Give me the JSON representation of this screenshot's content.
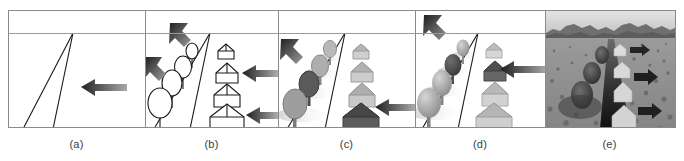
{
  "figure": {
    "title": "Progressive scene rendering stages along a perspective road",
    "panel_count": 5,
    "background_color": "#ffffff",
    "border_color": "#8a8a8a",
    "horizon_color": "#9a9a9a",
    "caption_color": "#3b3b3b"
  },
  "panels": [
    {
      "id": "a",
      "caption": "(a)",
      "description": "Empty scene: horizon line and two converging perspective road edges meeting at the vanishing point",
      "objects": {
        "trees": 0,
        "houses": 0
      },
      "road": {
        "vanishing_point": [
          64,
          22
        ],
        "left_edge_bottom": [
          14,
          118
        ],
        "right_edge_bottom": [
          44,
          118
        ]
      },
      "arrows": [
        {
          "name": "arrow-left-road",
          "x": 72,
          "y": 72,
          "length": 46,
          "direction": "left",
          "shade": "dark-gradient"
        }
      ],
      "style": "line-art-empty"
    },
    {
      "id": "b",
      "caption": "(b)",
      "description": "Line-drawing scene: outlined trees on the left of the road, outlined houses on the right",
      "objects": {
        "trees": 4,
        "houses": 4
      },
      "road": {
        "vanishing_point": [
          64,
          22
        ],
        "left_edge_bottom": [
          8,
          118
        ],
        "right_edge_bottom": [
          44,
          118
        ]
      },
      "arrows": [
        {
          "name": "arrow-diagonal-upper",
          "x": 28,
          "y": 18,
          "direction": "down-right",
          "shade": "dark-gradient"
        },
        {
          "name": "arrow-diagonal-lower",
          "x": 4,
          "y": 52,
          "direction": "down-right",
          "shade": "dark-gradient"
        },
        {
          "name": "arrow-left-mid",
          "x": 88,
          "y": 60,
          "length": 44,
          "direction": "left",
          "shade": "dark-gradient"
        },
        {
          "name": "arrow-left-bottom",
          "x": 88,
          "y": 100,
          "length": 44,
          "direction": "left",
          "shade": "dark-gradient"
        }
      ],
      "style": "wireframe-outline"
    },
    {
      "id": "c",
      "caption": "(c)",
      "description": "Flat-shaded scene: grey filled trees and houses with cast shadows; one tree and one house highlighted dark",
      "objects": {
        "trees": 4,
        "houses": 4,
        "highlighted_tree_index": 2,
        "highlighted_house_index": 4
      },
      "road": {
        "vanishing_point": [
          66,
          22
        ],
        "left_edge_bottom": [
          8,
          118
        ],
        "right_edge_bottom": [
          46,
          118
        ]
      },
      "arrows": [
        {
          "name": "arrow-diagonal-upper",
          "x": 6,
          "y": 32,
          "direction": "down-right",
          "shade": "dark-gradient"
        },
        {
          "name": "arrow-left-bottom",
          "x": 86,
          "y": 92,
          "length": 46,
          "direction": "left",
          "shade": "dark-gradient"
        }
      ],
      "style": "flat-shaded"
    },
    {
      "id": "d",
      "caption": "(d)",
      "description": "Smooth-shaded scene: softly shaded trees and houses with shadows; one tree and one house highlighted dark",
      "objects": {
        "trees": 4,
        "houses": 4,
        "highlighted_tree_index": 2,
        "highlighted_house_index": 2
      },
      "road": {
        "vanishing_point": [
          62,
          22
        ],
        "left_edge_bottom": [
          6,
          118
        ],
        "right_edge_bottom": [
          42,
          118
        ]
      },
      "arrows": [
        {
          "name": "arrow-diagonal-upper",
          "x": 12,
          "y": 8,
          "direction": "down-right",
          "shade": "dark-gradient"
        },
        {
          "name": "arrow-left-mid",
          "x": 74,
          "y": 54,
          "length": 46,
          "direction": "left",
          "shade": "dark-gradient"
        }
      ],
      "style": "smooth-shaded"
    },
    {
      "id": "e",
      "caption": "(e)",
      "description": "Photorealistic grayscale rendering: textured terrain, mountain skyline, dark road, pale houses and right-pointing arrows",
      "objects": {
        "trees": 3,
        "houses": 4
      },
      "scene": {
        "sky": "#cfcfcf",
        "mountains": "#6d6d6d",
        "ground": "#8f8f8f",
        "road": "#2b2b2b",
        "house_fill": "#dcdcdc"
      },
      "arrows": [
        {
          "name": "arrow-right-top",
          "x": 78,
          "y": 34,
          "direction": "right",
          "shade": "dark"
        },
        {
          "name": "arrow-right-mid",
          "x": 84,
          "y": 62,
          "direction": "right",
          "shade": "dark"
        },
        {
          "name": "arrow-right-bottom",
          "x": 84,
          "y": 92,
          "direction": "right",
          "shade": "dark"
        }
      ],
      "style": "photorealistic"
    }
  ]
}
